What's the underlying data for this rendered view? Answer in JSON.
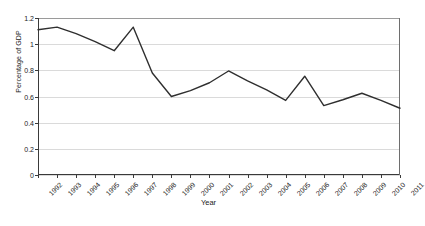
{
  "chart_data": {
    "type": "line",
    "title": "",
    "xlabel": "Year",
    "ylabel": "Percentage of GDP",
    "categories": [
      "1992",
      "1993",
      "1994",
      "1995",
      "1996",
      "1997",
      "1998",
      "1999",
      "2000",
      "2001",
      "2002",
      "2003",
      "2004",
      "2005",
      "2006",
      "2007",
      "2008",
      "2009",
      "2010",
      "2011"
    ],
    "values": [
      1.11,
      1.13,
      1.08,
      1.02,
      0.95,
      1.13,
      0.78,
      0.6,
      0.645,
      0.705,
      0.795,
      0.72,
      0.65,
      0.57,
      0.755,
      0.53,
      0.575,
      0.625,
      0.57,
      0.51
    ],
    "series": [
      {
        "name": "Percentage of GDP",
        "values": [
          1.11,
          1.13,
          1.08,
          1.02,
          0.95,
          1.13,
          0.78,
          0.6,
          0.645,
          0.705,
          0.795,
          0.72,
          0.65,
          0.57,
          0.755,
          0.53,
          0.575,
          0.625,
          0.57,
          0.51
        ]
      }
    ],
    "ylim": [
      0,
      1.2
    ],
    "yticks": [
      "0",
      "0.2",
      "0.4",
      "0.6",
      "0.8",
      "1",
      "1.2"
    ],
    "ytick_values": [
      0,
      0.2,
      0.4,
      0.6,
      0.8,
      1.0,
      1.2
    ],
    "grid": true,
    "legend": false,
    "line_color": "#2f2f2f",
    "grid_color": "#dadada",
    "axis_color": "#3a3a3a",
    "background": "#ffffff"
  }
}
